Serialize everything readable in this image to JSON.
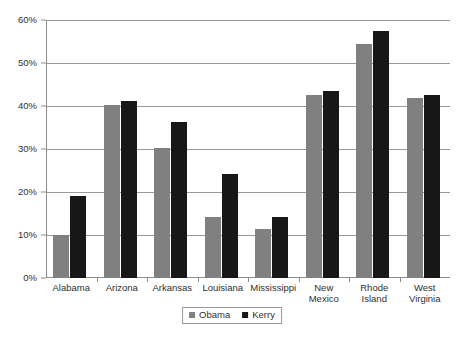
{
  "chart_data": {
    "type": "bar",
    "title": "",
    "subtitle": "",
    "xlabel": "",
    "ylabel": "",
    "ylim": [
      0,
      60
    ],
    "ytick_step": 10,
    "ytick_labels": [
      "0%",
      "10%",
      "20%",
      "30%",
      "40%",
      "50%",
      "60%"
    ],
    "ytick_values": [
      0,
      10,
      20,
      30,
      40,
      50,
      60
    ],
    "grid": true,
    "legend_position": "bottom-center",
    "categories": [
      "Alabama",
      "Arizona",
      "Arkansas",
      "Louisiana",
      "Mississippi",
      "New Mexico",
      "Rhode Island",
      "West Virginia"
    ],
    "category_lines": [
      [
        "Alabama"
      ],
      [
        "Arizona"
      ],
      [
        "Arkansas"
      ],
      [
        "Louisiana"
      ],
      [
        "Mississippi"
      ],
      [
        "New",
        "Mexico"
      ],
      [
        "Rhode",
        "Island"
      ],
      [
        "West",
        "Virginia"
      ]
    ],
    "series": [
      {
        "name": "Obama",
        "color": "#808080",
        "values": [
          10.0,
          40.3,
          30.2,
          14.3,
          11.5,
          42.5,
          54.5,
          41.8
        ]
      },
      {
        "name": "Kerry",
        "color": "#171717",
        "values": [
          19.0,
          41.2,
          36.2,
          24.2,
          14.3,
          43.5,
          57.5,
          42.5
        ]
      }
    ]
  },
  "legend": {
    "items": [
      {
        "label": "Obama",
        "swatch": "obama-swatch-icon"
      },
      {
        "label": "Kerry",
        "swatch": "kerry-swatch-icon"
      }
    ]
  },
  "colors": {
    "obama": "#808080",
    "kerry": "#171717",
    "gridline": "#9a9a9a",
    "axis": "#8d8d8d",
    "background": "#ffffff",
    "text": "#2f2f2f"
  }
}
